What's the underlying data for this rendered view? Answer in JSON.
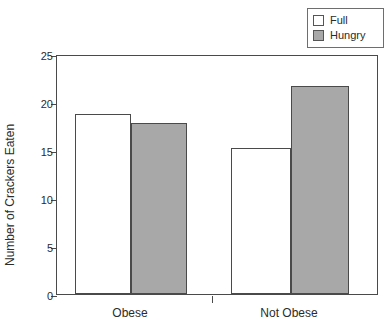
{
  "chart_data": {
    "type": "bar",
    "title": "",
    "subtitle": "",
    "xlabel": "",
    "ylabel": "Number of Crackers Eaten",
    "categories": [
      "Obese",
      "Not Obese"
    ],
    "series": [
      {
        "name": "Full",
        "color": "#ffffff",
        "values": [
          18.8,
          15.2
        ]
      },
      {
        "name": "Hungry",
        "color": "#a8a8a8",
        "values": [
          17.8,
          21.7
        ]
      }
    ],
    "ylim": [
      0,
      25
    ],
    "ytick_labels": [
      "0",
      "5",
      "10",
      "15",
      "20",
      "25"
    ],
    "ytick_values": [
      0,
      5,
      10,
      15,
      20,
      25
    ],
    "grid": false,
    "legend_position": "top-right",
    "bar_border_color": "#4a4a4a",
    "axis_color": "#4a4a4a",
    "background_color": "#ffffff"
  },
  "legend": {
    "entries": [
      {
        "label": "Full",
        "swatch_color": "#ffffff"
      },
      {
        "label": "Hungry",
        "swatch_color": "#a8a8a8"
      }
    ]
  },
  "axes": {
    "y_title": "Number of Crackers Eaten",
    "y_ticks": [
      {
        "label": "25",
        "value": 25
      },
      {
        "label": "20",
        "value": 20
      },
      {
        "label": "15",
        "value": 15
      },
      {
        "label": "10",
        "value": 10
      },
      {
        "label": "5",
        "value": 5
      },
      {
        "label": "0",
        "value": 0
      }
    ],
    "x_categories": [
      {
        "label": "Obese"
      },
      {
        "label": "Not Obese"
      }
    ]
  }
}
